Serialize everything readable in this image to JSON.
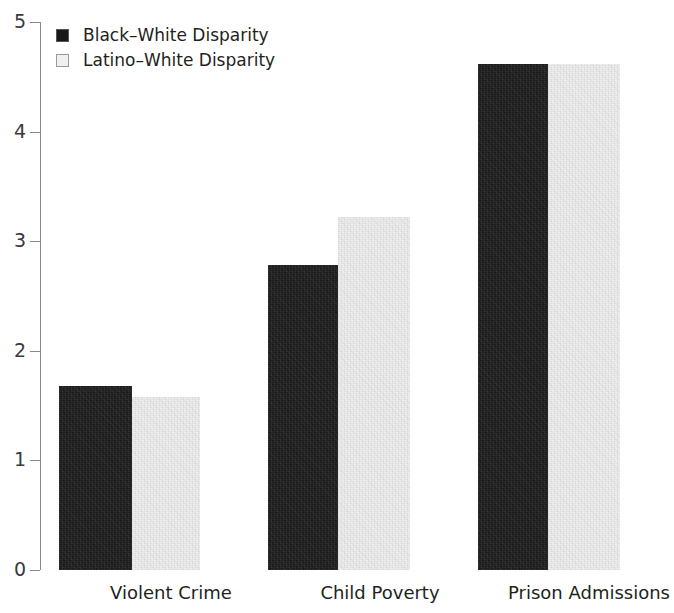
{
  "chart_data": {
    "type": "bar",
    "title": "",
    "subtitle": "",
    "xlabel": "",
    "ylabel": "",
    "categories": [
      "Violent Crime",
      "Child Poverty",
      "Prison Admissions"
    ],
    "series": [
      {
        "name": "Black–White Disparity",
        "color": "#1a1a1a",
        "values": [
          1.68,
          2.78,
          4.62
        ]
      },
      {
        "name": "Latino–White Disparity",
        "color": "#eeeeee",
        "values": [
          1.58,
          3.22,
          4.62
        ]
      }
    ],
    "ylim": [
      0,
      5
    ],
    "yticks": [
      0,
      1,
      2,
      3,
      4,
      5
    ],
    "ytick_labels": [
      "0",
      "1",
      "2",
      "3",
      "4",
      "5"
    ],
    "grid": false,
    "legend_position": "top-left",
    "axis_color": "#8a8a8a",
    "background": "#ffffff"
  },
  "legend": {
    "items": [
      {
        "label": "Black–White Disparity",
        "swatch": "dark-square-swatch"
      },
      {
        "label": "Latino–White Disparity",
        "swatch": "light-square-swatch"
      }
    ]
  }
}
